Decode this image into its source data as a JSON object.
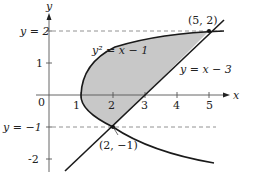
{
  "diagram": {
    "axes": {
      "x_label": "x",
      "y_label": "y",
      "origin_label": "0",
      "x_ticks": [
        "1",
        "2",
        "3",
        "4",
        "5"
      ],
      "y_ticks": [
        "1",
        "-2"
      ]
    },
    "guides": {
      "upper": "y = 2",
      "lower": "y = −1"
    },
    "curves": {
      "parabola": "y² = x − 1",
      "line": "y = x − 3"
    },
    "points": {
      "top": "(5, 2)",
      "bottom": "(2, −1)"
    },
    "colors": {
      "shade": "#c8c8c8",
      "curve": "#1a1a1a",
      "axis": "#555555",
      "dash": "#777777"
    }
  }
}
